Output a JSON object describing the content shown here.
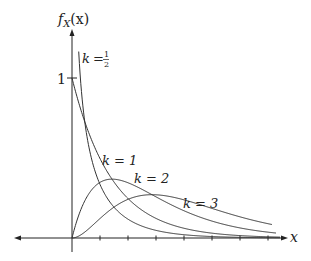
{
  "chart_data": {
    "type": "line",
    "title": "",
    "xlabel": "x",
    "ylabel": "f_X(x)",
    "y_ticks": [
      {
        "value": 1,
        "label": "1"
      }
    ],
    "x_ticks_count": 7,
    "x_tick_labels": [],
    "grid": false,
    "legend": "inline labels",
    "xlim": [
      0,
      5.3
    ],
    "ylim": [
      0,
      1.3
    ],
    "x": [
      0,
      0.25,
      0.5,
      1,
      1.5,
      2,
      2.5,
      3,
      4,
      5
    ],
    "series": [
      {
        "name": "k = 1/2",
        "k": 0.5,
        "values": [
          null,
          0.879,
          0.484,
          0.208,
          0.103,
          0.054,
          0.029,
          0.016,
          0.005,
          0.002
        ]
      },
      {
        "name": "k = 1",
        "k": 1,
        "values": [
          1.0,
          0.779,
          0.607,
          0.368,
          0.223,
          0.135,
          0.082,
          0.05,
          0.018,
          0.007
        ]
      },
      {
        "name": "k = 2",
        "k": 2,
        "values": [
          0.0,
          0.195,
          0.303,
          0.368,
          0.335,
          0.271,
          0.205,
          0.149,
          0.073,
          0.034
        ]
      },
      {
        "name": "k = 3",
        "k": 3,
        "values": [
          0.0,
          0.024,
          0.076,
          0.184,
          0.251,
          0.271,
          0.257,
          0.224,
          0.147,
          0.084
        ]
      }
    ]
  },
  "labels": {
    "y_axis": {
      "main": "f",
      "sub": "X",
      "arg": "(x)"
    },
    "x_axis": "x",
    "y_tick_one": "1",
    "k_half": {
      "k": "k",
      "eq": "=",
      "num": "1",
      "den": "2"
    },
    "k_one": "k = 1",
    "k_two": "k = 2",
    "k_three": "k = 3"
  },
  "colors": {
    "axis": "#222222",
    "curve": "#333333"
  }
}
